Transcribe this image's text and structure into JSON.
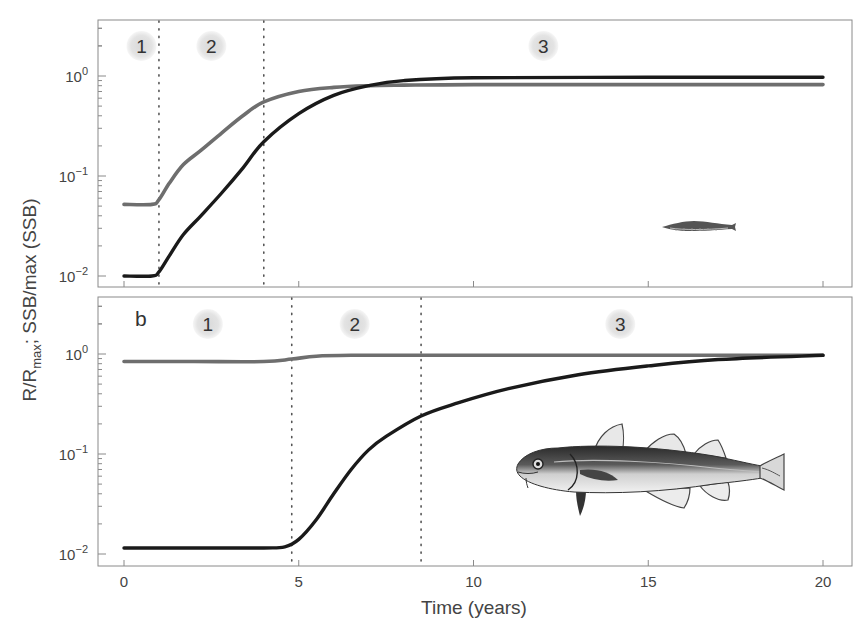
{
  "figure": {
    "ylabel_main": "R/R",
    "ylabel_sub": "max",
    "ylabel_rest": "; SSB/max (SSB)",
    "xlabel": "Time (years)",
    "xticks": [
      "0",
      "5",
      "10",
      "15",
      "20"
    ],
    "ytick_base": "10",
    "ytick_exponents": [
      "0",
      "−1",
      "−2"
    ],
    "panel_a": {
      "letter": "",
      "phases": [
        "1",
        "2",
        "3"
      ]
    },
    "panel_b": {
      "letter": "b",
      "phases": [
        "1",
        "2",
        "3"
      ]
    },
    "colors": {
      "black_series": "#1a1a1a",
      "gray_series": "#6e6e6e",
      "phase_bubble": "#e6e6e6",
      "frame": "#8a8a8a"
    }
  },
  "chart_data": [
    {
      "type": "line",
      "panel": "a",
      "title": "",
      "xlabel": "Time (years)",
      "ylabel": "R/R_max; SSB/max (SSB)",
      "xlim": [
        -1.2,
        20.8
      ],
      "ylim": [
        0.008,
        3.5
      ],
      "yscale": "log",
      "xticks": [
        0,
        5,
        10,
        15,
        20
      ],
      "yticks": [
        0.01,
        0.1,
        1
      ],
      "grid": false,
      "phase_boundaries": [
        1.0,
        4.0
      ],
      "phase_labels": [
        {
          "label": "1",
          "x": 0.5
        },
        {
          "label": "2",
          "x": 2.5
        },
        {
          "label": "3",
          "x": 12.0
        }
      ],
      "annotation": "small juvenile fish illustration (lower right)",
      "series": [
        {
          "name": "gray (R/R_max)",
          "color": "#6e6e6e",
          "x": [
            0,
            0.8,
            1.0,
            1.3,
            1.7,
            2.2,
            2.8,
            3.4,
            4.0,
            5.0,
            6.0,
            7.0,
            8.0,
            10.0,
            15.0,
            20.0
          ],
          "y": [
            0.052,
            0.052,
            0.058,
            0.085,
            0.13,
            0.18,
            0.27,
            0.4,
            0.55,
            0.7,
            0.77,
            0.8,
            0.81,
            0.82,
            0.82,
            0.82
          ]
        },
        {
          "name": "black (SSB/max SSB)",
          "color": "#1a1a1a",
          "x": [
            0,
            0.8,
            1.0,
            1.3,
            1.7,
            2.2,
            2.8,
            3.4,
            4.0,
            5.0,
            6.0,
            7.0,
            8.0,
            10.0,
            15.0,
            20.0
          ],
          "y": [
            0.01,
            0.01,
            0.011,
            0.016,
            0.026,
            0.04,
            0.068,
            0.12,
            0.22,
            0.42,
            0.64,
            0.8,
            0.9,
            0.96,
            0.97,
            0.97
          ]
        }
      ]
    },
    {
      "type": "line",
      "panel": "b",
      "title": "",
      "xlabel": "Time (years)",
      "ylabel": "R/R_max; SSB/max (SSB)",
      "xlim": [
        -1.2,
        20.8
      ],
      "ylim": [
        0.008,
        3.5
      ],
      "yscale": "log",
      "xticks": [
        0,
        5,
        10,
        15,
        20
      ],
      "yticks": [
        0.01,
        0.1,
        1
      ],
      "grid": false,
      "phase_boundaries": [
        4.8,
        8.5
      ],
      "phase_labels": [
        {
          "label": "1",
          "x": 2.4
        },
        {
          "label": "2",
          "x": 6.6
        },
        {
          "label": "3",
          "x": 14.2
        }
      ],
      "annotation": "adult cod illustration (center right)",
      "series": [
        {
          "name": "gray (R/R_max)",
          "color": "#6e6e6e",
          "x": [
            0,
            2,
            4,
            4.8,
            5.5,
            6.5,
            8,
            10,
            15,
            20
          ],
          "y": [
            0.84,
            0.84,
            0.84,
            0.89,
            0.95,
            0.97,
            0.97,
            0.97,
            0.97,
            0.97
          ]
        },
        {
          "name": "black (SSB/max SSB)",
          "color": "#1a1a1a",
          "x": [
            0,
            2,
            4,
            4.6,
            5.0,
            5.5,
            6.0,
            6.5,
            7.0,
            7.5,
            8.5,
            9.5,
            11,
            13,
            15,
            17,
            20
          ],
          "y": [
            0.0115,
            0.0115,
            0.0115,
            0.0118,
            0.014,
            0.022,
            0.04,
            0.07,
            0.11,
            0.15,
            0.24,
            0.32,
            0.45,
            0.62,
            0.76,
            0.88,
            0.97
          ]
        }
      ]
    }
  ]
}
